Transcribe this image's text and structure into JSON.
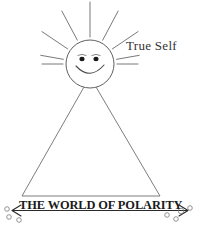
{
  "figure": {
    "title_label": "True Self",
    "baseline_label": "THE WORLD OF POLARITY",
    "bottom_partial_text": "",
    "background_color": "#ffffff",
    "ink_color": "#555555",
    "text_color": "#1a1a1a"
  },
  "chart_data": {
    "type": "diagram",
    "elements": [
      {
        "name": "sun",
        "label": "True Self",
        "cx": 90,
        "cy": 64,
        "r": 24,
        "ray_count": 11
      },
      {
        "name": "face",
        "eyes": 2,
        "mouth": "smile"
      },
      {
        "name": "triangle",
        "apex_x": 90,
        "apex_y": 88,
        "left_base_x": 22,
        "right_base_x": 160,
        "base_y": 196
      },
      {
        "name": "axis-arrow",
        "label": "THE WORLD OF POLARITY",
        "x1": 10,
        "x2": 190,
        "y": 210,
        "arrowheads": "both"
      },
      {
        "name": "bubbles-left",
        "count": 3
      },
      {
        "name": "bubbles-right",
        "count": 4
      }
    ]
  },
  "sun": {
    "rays": [
      {
        "a": -90,
        "r1": 27,
        "r2": 62
      },
      {
        "a": -62,
        "r1": 27,
        "r2": 60
      },
      {
        "a": -34,
        "r1": 27,
        "r2": 58
      },
      {
        "a": -118,
        "r1": 27,
        "r2": 60
      },
      {
        "a": -146,
        "r1": 27,
        "r2": 58
      },
      {
        "a": -170,
        "r1": 27,
        "r2": 50
      },
      {
        "a": -10,
        "r1": 27,
        "r2": 50
      },
      {
        "a": 180,
        "r1": 27,
        "r2": 48
      },
      {
        "a": 0,
        "r1": 27,
        "r2": 48
      }
    ]
  },
  "bubbles": {
    "left": [
      {
        "cx": 7,
        "cy": 209,
        "r": 2.3
      },
      {
        "cx": 9,
        "cy": 217,
        "r": 2.3
      },
      {
        "cx": 19,
        "cy": 220,
        "r": 2.3
      }
    ],
    "right": [
      {
        "cx": 167,
        "cy": 215,
        "r": 2.3
      },
      {
        "cx": 176,
        "cy": 219,
        "r": 2.3
      },
      {
        "cx": 181,
        "cy": 211,
        "r": 2.8
      },
      {
        "cx": 190,
        "cy": 208,
        "r": 2.3
      }
    ]
  }
}
